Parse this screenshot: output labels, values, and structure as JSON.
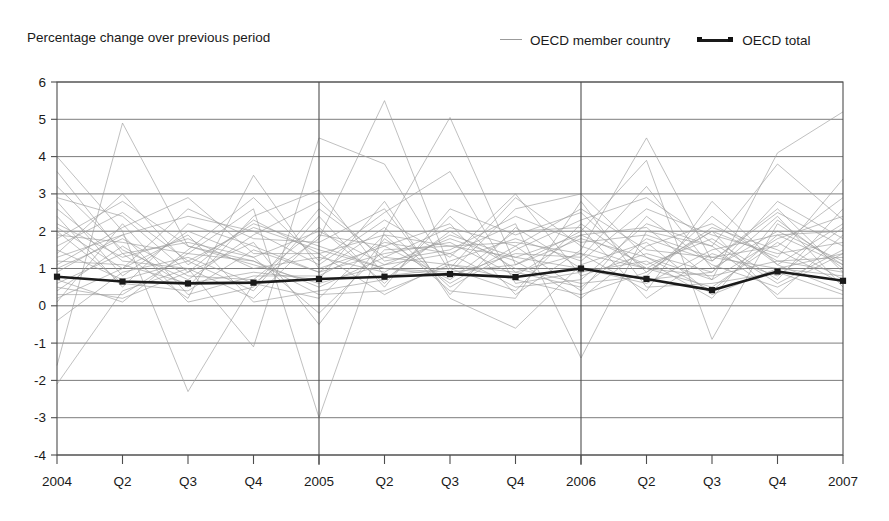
{
  "title": "",
  "subtitle": "Percentage change over previous period",
  "legend": [
    {
      "label": "OECD member country",
      "key": "line-light-gray",
      "color": "#9b9b9b"
    },
    {
      "label": "OECD total",
      "key": "line-dark-with-markers",
      "color": "#1a1a1a"
    }
  ],
  "colors": {
    "member_line": "#9b9b9b",
    "total_line": "#1a1a1a",
    "gridline": "#6e6e6e",
    "axis": "#4d4d4d",
    "background": "#ffffff",
    "text": "#1a1a1a"
  },
  "axis": {
    "y_ticks": [
      "6",
      "5",
      "4",
      "3",
      "2",
      "1",
      "0",
      "-1",
      "-2",
      "-3",
      "-4"
    ],
    "x_ticks": [
      "2004",
      "Q2",
      "Q3",
      "Q4",
      "2005",
      "Q2",
      "Q3",
      "Q4",
      "2006",
      "Q2",
      "Q3",
      "Q4",
      "2007"
    ],
    "year_separators": [
      "2005",
      "2006"
    ]
  },
  "chart_data": {
    "type": "line",
    "title": "",
    "subtitle": "Percentage change over previous period",
    "xlabel": "",
    "ylabel": "",
    "ylim": [
      -4,
      6
    ],
    "ytick_step": 1,
    "grid": true,
    "legend_position": "top-right",
    "categories": [
      "2004",
      "Q2",
      "Q3",
      "Q4",
      "2005",
      "Q2",
      "Q3",
      "Q4",
      "2006",
      "Q2",
      "Q3",
      "Q4",
      "2007"
    ],
    "series": [
      {
        "name": "OECD total",
        "emphasis": true,
        "markers": true,
        "values": [
          0.78,
          0.65,
          0.6,
          0.62,
          0.72,
          0.78,
          0.85,
          0.77,
          1.0,
          0.72,
          0.42,
          0.92,
          0.67
        ]
      },
      {
        "name": "OECD member country 1",
        "values": [
          -1.6,
          4.9,
          1.6,
          1.2,
          0.5,
          1.3,
          1.1,
          0.9,
          1.4,
          1.0,
          0.8,
          1.2,
          0.9
        ]
      },
      {
        "name": "OECD member country 2",
        "values": [
          3.6,
          1.4,
          0.2,
          3.5,
          1.0,
          1.6,
          2.2,
          0.3,
          1.5,
          4.5,
          1.2,
          2.5,
          1.6
        ]
      },
      {
        "name": "OECD member country 3",
        "values": [
          4.0,
          2.0,
          -2.3,
          0.6,
          1.8,
          5.5,
          1.0,
          0.4,
          2.2,
          1.0,
          2.0,
          1.3,
          3.4
        ]
      },
      {
        "name": "OECD member country 4",
        "values": [
          -2.1,
          0.4,
          1.0,
          -1.1,
          4.5,
          3.8,
          0.9,
          2.6,
          3.0,
          1.3,
          0.7,
          4.1,
          5.2
        ]
      },
      {
        "name": "OECD member country 5",
        "values": [
          1.9,
          1.7,
          1.4,
          2.6,
          -3.0,
          2.0,
          5.05,
          1.1,
          2.0,
          3.9,
          -0.9,
          2.2,
          1.1
        ]
      },
      {
        "name": "OECD member country 6",
        "values": [
          2.8,
          0.8,
          2.0,
          1.3,
          2.0,
          1.1,
          1.4,
          2.2,
          -1.4,
          2.0,
          1.6,
          3.8,
          2.3
        ]
      },
      {
        "name": "OECD member country 7",
        "values": [
          1.2,
          1.1,
          0.6,
          0.9,
          0.7,
          2.8,
          0.2,
          -0.6,
          1.1,
          1.7,
          0.3,
          1.0,
          0.8
        ]
      },
      {
        "name": "OECD member country 8",
        "values": [
          2.2,
          1.3,
          1.8,
          1.0,
          1.3,
          0.9,
          1.9,
          1.3,
          1.0,
          0.6,
          1.5,
          1.9,
          2.0
        ]
      },
      {
        "name": "OECD member country 9",
        "values": [
          0.5,
          0.2,
          0.9,
          1.7,
          -0.5,
          1.8,
          0.6,
          1.6,
          0.4,
          2.4,
          1.1,
          0.5,
          1.4
        ]
      },
      {
        "name": "OECD member country 10",
        "values": [
          1.6,
          2.5,
          1.2,
          0.4,
          2.4,
          0.5,
          2.6,
          1.9,
          2.5,
          0.9,
          2.1,
          1.5,
          0.6
        ]
      },
      {
        "name": "OECD member country 11",
        "values": [
          0.9,
          1.9,
          2.4,
          2.0,
          1.1,
          2.3,
          1.3,
          3.0,
          0.8,
          1.4,
          0.9,
          2.8,
          1.8
        ]
      },
      {
        "name": "OECD member country 12",
        "values": [
          2.0,
          0.6,
          0.4,
          1.5,
          0.9,
          1.4,
          1.7,
          0.8,
          1.9,
          1.1,
          1.8,
          0.7,
          2.6
        ]
      },
      {
        "name": "OECD member country 13",
        "values": [
          1.4,
          3.0,
          1.1,
          2.2,
          1.6,
          1.0,
          0.8,
          1.4,
          1.3,
          3.2,
          1.0,
          2.0,
          1.2
        ]
      },
      {
        "name": "OECD member country 14",
        "values": [
          0.2,
          1.0,
          1.9,
          0.1,
          0.4,
          0.7,
          2.0,
          1.0,
          0.6,
          0.8,
          2.4,
          1.1,
          0.4
        ]
      },
      {
        "name": "OECD member country 15",
        "values": [
          3.2,
          1.5,
          0.7,
          1.9,
          2.8,
          1.2,
          1.5,
          2.4,
          1.7,
          1.9,
          1.3,
          1.6,
          2.9
        ]
      },
      {
        "name": "OECD member country 16",
        "values": [
          -0.4,
          0.9,
          1.3,
          0.6,
          0.2,
          1.9,
          0.4,
          0.2,
          2.8,
          0.5,
          0.6,
          0.9,
          0.3
        ]
      },
      {
        "name": "OECD member country 17",
        "values": [
          1.1,
          2.1,
          2.9,
          1.4,
          1.4,
          0.3,
          1.2,
          1.8,
          1.2,
          2.6,
          1.9,
          1.4,
          1.7
        ]
      },
      {
        "name": "OECD member country 18",
        "values": [
          0.7,
          0.1,
          1.5,
          2.9,
          1.2,
          2.5,
          3.6,
          0.6,
          0.9,
          1.2,
          0.2,
          2.3,
          1.0
        ]
      },
      {
        "name": "OECD member country 19",
        "values": [
          2.6,
          1.2,
          1.0,
          0.2,
          1.9,
          1.6,
          0.7,
          2.0,
          2.1,
          0.2,
          1.4,
          0.8,
          2.1
        ]
      },
      {
        "name": "OECD member country 20",
        "values": [
          1.8,
          2.8,
          1.6,
          1.1,
          0.6,
          1.1,
          1.8,
          1.2,
          0.2,
          1.6,
          2.2,
          1.2,
          1.3
        ]
      },
      {
        "name": "OECD member country 21",
        "values": [
          0.4,
          1.6,
          0.5,
          2.4,
          3.1,
          0.8,
          1.0,
          2.9,
          1.6,
          1.0,
          0.5,
          1.7,
          0.7
        ]
      },
      {
        "name": "OECD member country 22",
        "values": [
          2.4,
          0.5,
          2.2,
          1.6,
          0.9,
          2.1,
          0.5,
          1.5,
          2.3,
          2.9,
          1.7,
          0.6,
          1.5
        ]
      },
      {
        "name": "OECD member country 23",
        "values": [
          1.0,
          1.8,
          0.8,
          0.7,
          2.1,
          0.6,
          2.4,
          0.9,
          0.5,
          1.8,
          1.2,
          2.6,
          0.9
        ]
      },
      {
        "name": "OECD member country 24",
        "values": [
          0.6,
          1.4,
          1.7,
          1.3,
          -0.2,
          1.5,
          1.6,
          1.7,
          1.4,
          0.4,
          2.8,
          1.1,
          2.2
        ]
      },
      {
        "name": "OECD member country 25",
        "values": [
          1.5,
          0.7,
          1.2,
          2.1,
          1.5,
          1.0,
          0.9,
          1.1,
          1.8,
          1.3,
          0.4,
          1.9,
          1.1
        ]
      },
      {
        "name": "OECD member country 26",
        "values": [
          0.1,
          2.2,
          0.3,
          0.8,
          0.8,
          1.7,
          1.4,
          0.5,
          0.7,
          2.2,
          1.6,
          0.3,
          1.9
        ]
      },
      {
        "name": "OECD member country 27",
        "values": [
          2.1,
          1.0,
          2.6,
          1.8,
          1.7,
          2.6,
          0.3,
          2.1,
          1.0,
          0.7,
          0.9,
          2.4,
          0.5
        ]
      },
      {
        "name": "OECD member country 28",
        "values": [
          1.3,
          1.9,
          0.1,
          0.5,
          2.6,
          1.3,
          2.1,
          1.6,
          2.6,
          1.5,
          1.3,
          1.0,
          1.4
        ]
      },
      {
        "name": "OECD member country 29",
        "values": [
          0.3,
          0.3,
          1.4,
          1.2,
          0.3,
          0.4,
          1.1,
          0.7,
          0.3,
          0.9,
          2.0,
          0.2,
          0.2
        ]
      },
      {
        "name": "OECD member country 30",
        "values": [
          2.9,
          2.4,
          0.9,
          2.3,
          1.4,
          1.9,
          1.6,
          1.3,
          1.9,
          2.1,
          0.7,
          1.8,
          2.4
        ]
      }
    ]
  }
}
